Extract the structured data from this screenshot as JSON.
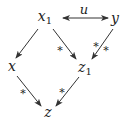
{
  "diagram": {
    "type": "commutative-diagram",
    "colors": {
      "stroke": "#333333",
      "text": "#222222",
      "background": "#ffffff"
    },
    "nodes": {
      "x1": {
        "base": "x",
        "sub": "1",
        "pos": [
          45,
          17
        ]
      },
      "y": {
        "base": "y",
        "sub": "",
        "pos": [
          115,
          17
        ]
      },
      "x": {
        "base": "x",
        "sub": "",
        "pos": [
          12,
          66
        ]
      },
      "z1": {
        "base": "z",
        "sub": "1",
        "pos": [
          84,
          68
        ]
      },
      "z": {
        "base": "z",
        "sub": "",
        "pos": [
          48,
          112
        ]
      }
    },
    "edges": [
      {
        "from": "x1",
        "to": "y",
        "label": "u",
        "style": "double-headed"
      },
      {
        "from": "x1",
        "to": "x",
        "label": "",
        "style": "arrow"
      },
      {
        "from": "x1",
        "to": "z1",
        "label": "*",
        "style": "arrow"
      },
      {
        "from": "y",
        "to": "z1",
        "label": "*/*",
        "style": "arrow"
      },
      {
        "from": "x",
        "to": "z",
        "label": "*",
        "style": "arrow"
      },
      {
        "from": "z1",
        "to": "z",
        "label": "*",
        "style": "arrow"
      }
    ],
    "labels": {
      "u": "u",
      "x1_z1": "*",
      "y_z1_left": "*",
      "y_z1_right": "*",
      "x_z": "*",
      "z1_z": "*"
    }
  }
}
